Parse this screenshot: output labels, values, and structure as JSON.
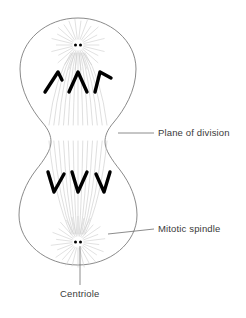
{
  "figure": {
    "background_color": "#ffffff",
    "outline_color": "#7d7d7d",
    "fiber_color": "#c9c9c9",
    "chromosome_color": "#000000",
    "label_color": "#3a3a3a",
    "leader_color": "#6e6e6e"
  },
  "labels": [
    {
      "id": "plane-of-division",
      "text": "Plane of division",
      "x": 158,
      "y": 136,
      "leader": {
        "x1": 118,
        "y1": 133,
        "x2": 154,
        "y2": 133
      }
    },
    {
      "id": "mitotic-spindle",
      "text": "Mitotic spindle",
      "x": 158,
      "y": 232,
      "leader": {
        "x1": 108,
        "y1": 234,
        "x2": 154,
        "y2": 229
      }
    },
    {
      "id": "centriole",
      "text": "Centriole",
      "x": 60,
      "y": 297,
      "leader": {
        "x1": 80,
        "y1": 246,
        "x2": 80,
        "y2": 285
      }
    }
  ],
  "cell": {
    "outline_path": "M 78 18 C 110 18 136 41 136 69 C 136 91 124 110 114 122 C 107 130 105 136 105 142 C 105 150 112 160 120 170 C 130 183 137 199 137 215 C 137 243 110 265 78 265 C 46 265 19 243 19 215 C 19 199 26 183 36 170 C 44 160 51 150 51 142 C 51 136 49 130 42 122 C 32 110 20 91 20 69 C 20 41 46 18 78 18 Z",
    "furrow_y": 133,
    "poles": [
      {
        "id": "top-pole",
        "x": 78,
        "y": 45
      },
      {
        "id": "bottom-pole",
        "x": 78,
        "y": 242
      }
    ]
  },
  "centrioles": [
    {
      "pole": "top",
      "dots": [
        {
          "x": 75.5,
          "y": 45
        },
        {
          "x": 80.5,
          "y": 45
        }
      ],
      "radius": 1.5
    },
    {
      "pole": "bottom",
      "dots": [
        {
          "x": 75.5,
          "y": 242
        },
        {
          "x": 80.5,
          "y": 242
        }
      ],
      "radius": 1.5
    }
  ],
  "chromosomes": {
    "upper_group": {
      "orientation": "apex-up",
      "count": 3,
      "shapes": [
        "M 45 92 L 58 72 L 62 80",
        "M 69 92 L 78 72 L 87 92",
        "M 95 92 L 100 72 L 111 78"
      ]
    },
    "lower_group": {
      "orientation": "apex-down",
      "count": 3,
      "shapes": [
        "M 48 172 L 54 192 L 64 174",
        "M 72 172 L 78 192 L 87 172",
        "M 96 174 L 104 192 L 110 172"
      ]
    },
    "stroke_width": 3.4
  },
  "aster_rays": {
    "count_per_pole": 26,
    "inner_radius": 6,
    "outer_radius_min": 16,
    "outer_radius_max": 27
  },
  "spindle_fibers": {
    "count_per_pole": 13,
    "description": "curved fibers fanning from each pole toward the cell equator"
  }
}
